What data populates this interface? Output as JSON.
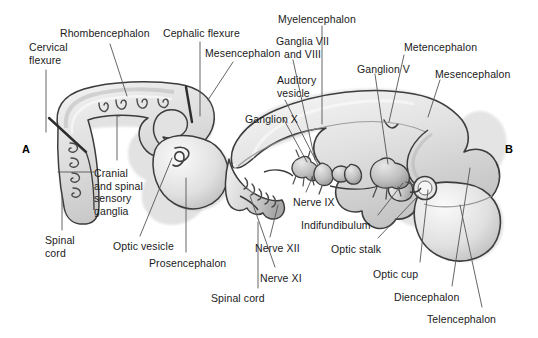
{
  "figure": {
    "kind": "embryology-brain-development-diagram",
    "background_color": "#ffffff",
    "outline_color": "#3a3a3a",
    "fill_light": "#f2f2f2",
    "fill_mid": "#d9d9d9",
    "fill_dark": "#b8b8b8",
    "leader_color": "#555555",
    "panels": [
      {
        "id": "A",
        "letter": "A",
        "x": 22,
        "y": 143
      },
      {
        "id": "B",
        "letter": "B",
        "x": 505,
        "y": 143
      }
    ]
  },
  "labels": [
    {
      "name": "label-cervical-flexure",
      "text": "Cervical\nflexure",
      "x": 29,
      "y": 41,
      "align": "left"
    },
    {
      "name": "label-rhombencephalon",
      "text": "Rhombencephalon",
      "x": 60,
      "y": 27,
      "align": "left"
    },
    {
      "name": "label-cephalic-flexure",
      "text": "Cephalic flexure",
      "x": 163,
      "y": 27,
      "align": "left"
    },
    {
      "name": "label-mesencephalon-a",
      "text": "Mesencephalon",
      "x": 205,
      "y": 47,
      "align": "left"
    },
    {
      "name": "label-cranial-spinal-ganglia",
      "text": "Cranial\nand spinal\nsensory\nganglia",
      "x": 94,
      "y": 167,
      "align": "left"
    },
    {
      "name": "label-spinal-cord-a",
      "text": "Spinal\ncord",
      "x": 45,
      "y": 234,
      "align": "left"
    },
    {
      "name": "label-optic-vesicle",
      "text": "Optic vesicle",
      "x": 113,
      "y": 240,
      "align": "left"
    },
    {
      "name": "label-prosencephalon",
      "text": "Prosencephalon",
      "x": 149,
      "y": 257,
      "align": "left"
    },
    {
      "name": "label-myelencephalon",
      "text": "Myelencephalon",
      "x": 317,
      "y": 13,
      "align": "center"
    },
    {
      "name": "label-ganglia-vii-viii",
      "text": "Ganglia VII\nand VIII",
      "x": 329,
      "y": 35,
      "align": "right"
    },
    {
      "name": "label-ganglion-v",
      "text": "Ganglion V",
      "x": 357,
      "y": 63,
      "align": "left"
    },
    {
      "name": "label-metencephalon",
      "text": "Metencephalon",
      "x": 404,
      "y": 41,
      "align": "left"
    },
    {
      "name": "label-mesencephalon-b",
      "text": "Mesencephalon",
      "x": 435,
      "y": 68,
      "align": "left"
    },
    {
      "name": "label-auditory-vesicle",
      "text": "Auditory\nvesicle",
      "x": 277,
      "y": 74,
      "align": "left"
    },
    {
      "name": "label-ganglion-x",
      "text": "Ganglion X",
      "x": 245,
      "y": 113,
      "align": "left"
    },
    {
      "name": "label-nerve-ix",
      "text": "Nerve IX",
      "x": 293,
      "y": 196,
      "align": "left"
    },
    {
      "name": "label-nerve-xii",
      "text": "Nerve XII",
      "x": 255,
      "y": 242,
      "align": "left"
    },
    {
      "name": "label-nerve-xi",
      "text": "Nerve XI",
      "x": 260,
      "y": 272,
      "align": "left"
    },
    {
      "name": "label-spinal-cord-b",
      "text": "Spinal cord",
      "x": 211,
      "y": 292,
      "align": "left"
    },
    {
      "name": "label-indifundibulum",
      "text": "Indifundibulum",
      "x": 301,
      "y": 219,
      "align": "left"
    },
    {
      "name": "label-optic-stalk",
      "text": "Optic stalk",
      "x": 331,
      "y": 243,
      "align": "left"
    },
    {
      "name": "label-optic-cup",
      "text": "Optic cup",
      "x": 373,
      "y": 268,
      "align": "left"
    },
    {
      "name": "label-diencephalon",
      "text": "Diencephalon",
      "x": 394,
      "y": 291,
      "align": "left"
    },
    {
      "name": "label-telencephalon",
      "text": "Telencephalon",
      "x": 427,
      "y": 313,
      "align": "left"
    }
  ],
  "leaders": [
    {
      "name": "leader-cervical-flexure",
      "d": "M 46,70 L 46,132"
    },
    {
      "name": "leader-rhombencephalon",
      "d": "M 110,44 L 127,96"
    },
    {
      "name": "leader-cephalic-flexure",
      "d": "M 200,42 L 200,116"
    },
    {
      "name": "leader-mesencephalon-a",
      "d": "M 233,62 L 208,100"
    },
    {
      "name": "leader-cranial-ganglia-upper",
      "d": "M 117,160 L 117,116 L 120,116"
    },
    {
      "name": "leader-cranial-ganglia-lower",
      "d": "M 94,172 L 58,172"
    },
    {
      "name": "leader-spinal-cord-a",
      "d": "M 62,230 L 62,196"
    },
    {
      "name": "leader-optic-vesicle",
      "d": "M 140,236 L 172,158"
    },
    {
      "name": "leader-prosencephalon",
      "d": "M 186,252 L 186,178"
    },
    {
      "name": "leader-myelencephalon",
      "d": "M 322,26 L 322,124"
    },
    {
      "name": "leader-ganglia-vii-viii",
      "d": "M 293,60 L 315,160"
    },
    {
      "name": "leader-ganglion-v",
      "d": "M 375,74 L 388,164"
    },
    {
      "name": "leader-metencephalon",
      "d": "M 404,55 L 389,122"
    },
    {
      "name": "leader-mesencephalon-b",
      "d": "M 440,80 L 428,117"
    },
    {
      "name": "leader-auditory-vesicle",
      "d": "M 285,100 L 318,165"
    },
    {
      "name": "leader-ganglion-x",
      "d": "M 283,118 L 307,162"
    },
    {
      "name": "leader-nerve-ix",
      "d": "M 306,192 L 313,176"
    },
    {
      "name": "leader-nerve-xii",
      "d": "M 270,237 L 278,205"
    },
    {
      "name": "leader-nerve-xi",
      "d": "M 275,267 L 250,196"
    },
    {
      "name": "leader-spinal-cord-b",
      "d": "M 258,288 L 258,222"
    },
    {
      "name": "leader-indifundibulum",
      "d": "M 378,215 L 403,183"
    },
    {
      "name": "leader-optic-stalk",
      "d": "M 378,238 L 418,196"
    },
    {
      "name": "leader-optic-cup",
      "d": "M 420,262 L 428,190"
    },
    {
      "name": "leader-diencephalon",
      "d": "M 452,286 L 470,168"
    },
    {
      "name": "leader-telencephalon",
      "d": "M 482,307 L 460,205"
    }
  ]
}
